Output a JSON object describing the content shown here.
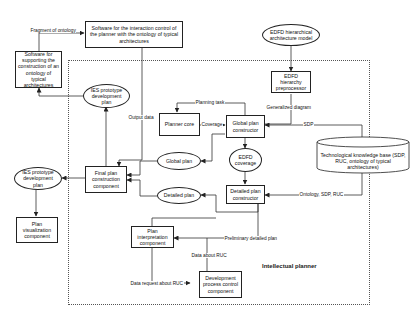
{
  "diagram": {
    "region": {
      "title": "Intellectual planner"
    },
    "nodes": {
      "interaction_control": "Software for the interaction control of the planner with the ontology of typical architectures",
      "ontology_support": "Software for supporting the construction of an ontology of typical architectures",
      "ies_plan_top": "IES prototype development plan",
      "edfd_model": "EDFD hierarchical architecture model",
      "edfd_preprocessor": "EDFD hierarchy preprocessor",
      "planner_core": "Planner core",
      "global_plan_constructor": "Global plan constructor",
      "global_plan": "Global plan",
      "edfd_coverage": "EDFD coverage",
      "tech_knowledge_base": "Technological knowledge base (SDP, RUC, ontology of typical architectures)",
      "final_plan": "Final plan construction component",
      "ies_plan_left": "IES prototype development plan",
      "detailed_plan": "Detailed plan",
      "detailed_plan_constructor": "Detailed plan constructor",
      "plan_visualization": "Plan visualization component",
      "plan_interpretation": "Plan interpretation component",
      "development_process_control": "Development process control component"
    },
    "edge_labels": {
      "fragment_of_ontology": "Fragment of ontology",
      "output_data": "Output data",
      "planning_task": "Planning task",
      "generalized_diagram": "Generalized diagram",
      "coverage": "Coverage",
      "sdp": "SDP",
      "ontology_sdp_ruc": "Ontology, SDP, RUC",
      "preliminary_detailed_plan": "Preliminary detailed plan",
      "data_about_ruc": "Data about RUC",
      "data_request_about_ruc": "Data request about RUC"
    }
  }
}
